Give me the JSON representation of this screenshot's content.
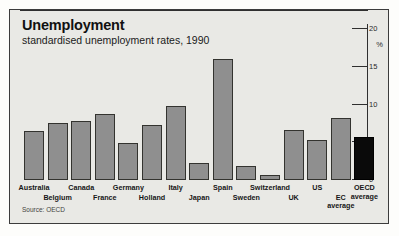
{
  "figure": {
    "title": "Unemployment",
    "subtitle": "standardised unemployment rates, 1990",
    "source": "Source: OECD",
    "unit_label": "%",
    "bar_color": "#8f8f8f",
    "highlight_color": "#0a0a0a",
    "background_color": "#e9e9e5",
    "frame_color": "#3c3c3c"
  },
  "chart_data": {
    "type": "bar",
    "title": "Unemployment",
    "subtitle": "standardised unemployment rates, 1990",
    "xlabel": "",
    "ylabel": "%",
    "ylim": [
      0,
      20
    ],
    "yticks": [
      0,
      5,
      10,
      15,
      20
    ],
    "ytick_labels": [
      "0",
      "5",
      "10",
      "15",
      "20"
    ],
    "grid": false,
    "legend": false,
    "source": "Source: OECD",
    "categories": [
      "Australia",
      "Belgium",
      "Canada",
      "France",
      "Germany",
      "Holland",
      "Italy",
      "Japan",
      "Spain",
      "Sweden",
      "Switzerland",
      "UK",
      "US",
      "EC average",
      "OECD average"
    ],
    "values": [
      6.4,
      7.4,
      7.7,
      8.6,
      4.8,
      7.1,
      9.7,
      2.1,
      15.9,
      1.7,
      0.5,
      6.5,
      5.2,
      8.1,
      5.6
    ],
    "highlighted": [
      "OECD average"
    ],
    "label_rows": [
      0,
      1,
      0,
      1,
      0,
      1,
      0,
      1,
      0,
      1,
      0,
      1,
      0,
      1,
      0
    ]
  }
}
